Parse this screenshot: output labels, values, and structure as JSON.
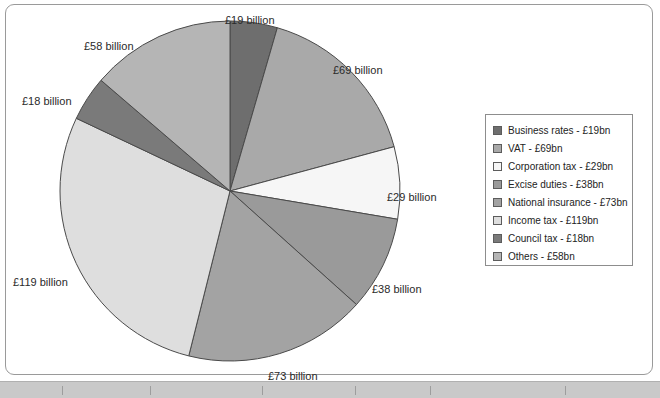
{
  "chart_data": {
    "type": "pie",
    "title": "",
    "unit": "£ billion",
    "total": 423,
    "categories": [
      "Business rates",
      "VAT",
      "Corporation tax",
      "Excise duties",
      "National insurance",
      "Income tax",
      "Council tax",
      "Others"
    ],
    "values": [
      19,
      69,
      29,
      38,
      73,
      119,
      18,
      58
    ],
    "colors": [
      "#6e6e6e",
      "#a9a9a9",
      "#f6f6f6",
      "#9a9a9a",
      "#a3a3a3",
      "#dedede",
      "#7a7a7a",
      "#b5b5b5"
    ],
    "slice_labels": [
      "£19 billion",
      "£69 billion",
      "£29 billion",
      "£38 billion",
      "£73 billion",
      "£119 billion",
      "£18 billion",
      "£58 billion"
    ],
    "legend_position": "right",
    "grid": false,
    "start_angle_deg": 0,
    "direction": "clockwise"
  },
  "legend": {
    "items": [
      {
        "label": "Business rates - £19bn",
        "color": "#6e6e6e"
      },
      {
        "label": "VAT - £69bn",
        "color": "#a9a9a9"
      },
      {
        "label": "Corporation tax - £29bn",
        "color": "#f6f6f6"
      },
      {
        "label": "Excise duties - £38bn",
        "color": "#9a9a9a"
      },
      {
        "label": "National insurance - £73bn",
        "color": "#a3a3a3"
      },
      {
        "label": "Income tax - £119bn",
        "color": "#dedede"
      },
      {
        "label": "Council tax - £18bn",
        "color": "#7a7a7a"
      },
      {
        "label": "Others - £58bn",
        "color": "#b5b5b5"
      }
    ]
  },
  "labels": {
    "business_rates": "£19 billion",
    "vat": "£69 billion",
    "corporation_tax": "£29 billion",
    "excise_duties": "£38 billion",
    "national_insurance": "£73 billion",
    "income_tax": "£119 billion",
    "council_tax": "£18 billion",
    "others": "£58 billion"
  }
}
